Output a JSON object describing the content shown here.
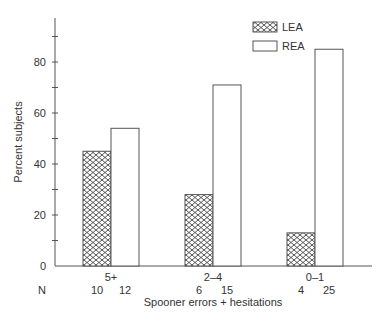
{
  "chart_data": {
    "type": "bar",
    "title": "",
    "xlabel": "Spooner errors + hesitations",
    "ylabel": "Percent subjects",
    "ylim": [
      0,
      95
    ],
    "yticks_labeled": [
      0,
      20,
      40,
      60,
      80
    ],
    "yticks_minor": [
      10,
      30,
      50,
      70,
      90
    ],
    "categories": [
      "5+",
      "2–4",
      "0–1"
    ],
    "series": [
      {
        "name": "LEA",
        "pattern": "crosshatch",
        "values": [
          45,
          28,
          13
        ],
        "n": [
          10,
          6,
          4
        ]
      },
      {
        "name": "REA",
        "pattern": "open",
        "values": [
          54,
          71,
          85
        ],
        "n": [
          12,
          15,
          25
        ]
      }
    ],
    "n_label": "N",
    "legend": {
      "position": "upper-right",
      "entries": [
        "LEA",
        "REA"
      ]
    },
    "grid": false
  },
  "colors": {
    "axis": "#555555",
    "bar_stroke": "#555555",
    "hatch": "#444444",
    "text": "#333333"
  }
}
